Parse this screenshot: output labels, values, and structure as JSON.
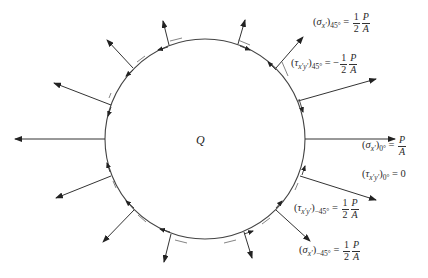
{
  "diagram": {
    "center_label": "Q",
    "circle": {
      "cx": 205,
      "cy": 139,
      "r": 100,
      "stroke": "#444444"
    },
    "annotations": [
      {
        "id": "sigma_45",
        "symbol": "σ",
        "sub_var": "x'",
        "angle": "45°",
        "equals": "=",
        "sign": "",
        "num": "1",
        "den": "2",
        "num2": "P",
        "den2": "A",
        "text": "(σx')45° = 1/2 P/A"
      },
      {
        "id": "tau_45",
        "symbol": "τ",
        "sub_var": "x'y'",
        "angle": "45°",
        "equals": "=",
        "sign": "−",
        "num": "1",
        "den": "2",
        "num2": "P",
        "den2": "A",
        "text": "(τx'y')45° = −1/2 P/A"
      },
      {
        "id": "sigma_0",
        "symbol": "σ",
        "sub_var": "x'",
        "angle": "0°",
        "equals": "=",
        "num2": "P",
        "den2": "A",
        "text": "(σx')0° = P/A"
      },
      {
        "id": "tau_0",
        "symbol": "τ",
        "sub_var": "x'y'",
        "angle": "0°",
        "equals": "=",
        "value": "0",
        "text": "(τx'y')0° = 0"
      },
      {
        "id": "tau_m45",
        "symbol": "τ",
        "sub_var": "x'y'",
        "angle": "−45°",
        "equals": "=",
        "sign": "",
        "num": "1",
        "den": "2",
        "num2": "P",
        "den2": "A",
        "text": "(τx'y')−45° = 1/2 P/A"
      },
      {
        "id": "sigma_m45",
        "symbol": "σ",
        "sub_var": "x'",
        "angle": "−45°",
        "equals": "=",
        "sign": "",
        "num": "1",
        "den": "2",
        "num2": "P",
        "den2": "A",
        "text": "(σx')−45° = 1/2 P/A"
      }
    ]
  }
}
